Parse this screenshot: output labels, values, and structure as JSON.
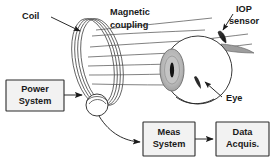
{
  "figure": {
    "type": "schematic-diagram",
    "background_color": "#ffffff",
    "line_color": "#2b2b2b",
    "box_fill_color": "#f2f2f2",
    "iris_color": "#b9b9b9",
    "pupil_color": "#1a1a1a"
  },
  "labels": {
    "coil": "Coil",
    "magnetic": "Magnetic",
    "coupling": "coupling",
    "iop": "IOP",
    "sensor": "sensor",
    "eye": "Eye"
  },
  "boxes": [
    {
      "id": "power-system",
      "line1": "Power",
      "line2": "System"
    },
    {
      "id": "meas-system",
      "line1": "Meas",
      "line2": "System"
    },
    {
      "id": "data-acquis",
      "line1": "Data",
      "line2": "Acquis."
    }
  ],
  "components": {
    "coil_turns": 4,
    "flux_lines": 6,
    "coil_junction": "wire-loop-node",
    "eye_parts": [
      "sclera-sphere",
      "cornea-iris",
      "pupil",
      "iop-sensor",
      "optic-shadow"
    ]
  }
}
